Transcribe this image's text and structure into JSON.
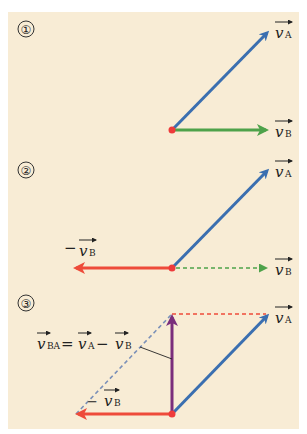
{
  "figure": {
    "background_color": "#f8ecd5",
    "colors": {
      "vA": "#3b6fb0",
      "vB": "#4ea24a",
      "neg_vB": "#ee4b3a",
      "vBA": "#7a2e7c",
      "dashed_blue": "#7b90b8",
      "dashed_red": "#ee4b3a",
      "origin_dot": "#ee3b3b"
    },
    "panels": [
      {
        "step": "①",
        "labels": {
          "vA": "v",
          "vA_sub": "A",
          "vB": "v",
          "vB_sub": "B"
        }
      },
      {
        "step": "②",
        "labels": {
          "vA": "v",
          "vA_sub": "A",
          "vB": "v",
          "vB_sub": "B",
          "neg_vB_prefix": "−",
          "neg_vB": "v",
          "neg_vB_sub": "B"
        }
      },
      {
        "step": "③",
        "labels": {
          "vA": "v",
          "vA_sub": "A",
          "neg_vB_prefix": "−",
          "neg_vB": "v",
          "neg_vB_sub": "B",
          "equation": {
            "lhs": "v",
            "lhs_sub": "BA",
            "eq": "=",
            "t1": "v",
            "t1_sub": "A",
            "minus": "−",
            "t2": "v",
            "t2_sub": "B"
          }
        }
      }
    ]
  }
}
